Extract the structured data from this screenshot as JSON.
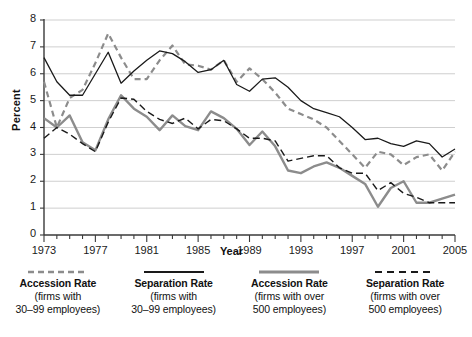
{
  "chart_data": {
    "type": "line",
    "title": "",
    "xlabel": "Year",
    "ylabel": "Percent",
    "xlim": [
      1973,
      2005
    ],
    "ylim": [
      0,
      8
    ],
    "yticks": [
      0,
      1,
      2,
      3,
      4,
      5,
      6,
      7,
      8
    ],
    "xticks": [
      1973,
      1977,
      1981,
      1985,
      1989,
      1993,
      1997,
      2001,
      2005
    ],
    "xtick_labels": [
      "1973",
      "1977",
      "1981",
      "1985",
      "1989",
      "1993",
      "1997",
      "2001",
      "2005"
    ],
    "grid": "horizontal",
    "legend_position": "bottom",
    "x": [
      1973,
      1974,
      1975,
      1976,
      1977,
      1978,
      1979,
      1980,
      1981,
      1982,
      1983,
      1984,
      1985,
      1986,
      1987,
      1988,
      1989,
      1990,
      1991,
      1992,
      1993,
      1994,
      1995,
      1996,
      1997,
      1998,
      1999,
      2000,
      2001,
      2002,
      2003,
      2004,
      2005
    ],
    "series": [
      {
        "name": "Accession Rate (firms with 30-99 employees)",
        "style": "dashed",
        "color": "#8c8c8c",
        "width": 2.2,
        "values": [
          5.7,
          4.0,
          5.1,
          5.4,
          6.4,
          7.5,
          6.6,
          5.8,
          5.8,
          6.5,
          7.05,
          6.35,
          6.3,
          6.15,
          6.5,
          5.7,
          6.2,
          5.8,
          5.3,
          4.7,
          4.5,
          4.3,
          4.0,
          3.5,
          3.0,
          2.5,
          3.1,
          3.0,
          2.6,
          2.9,
          3.0,
          2.4,
          3.1
        ]
      },
      {
        "name": "Separation Rate (firms with 30-99 employees)",
        "style": "solid",
        "color": "#1a1a1a",
        "width": 1.3,
        "values": [
          6.6,
          5.7,
          5.2,
          5.2,
          6.0,
          6.8,
          5.65,
          6.1,
          6.5,
          6.85,
          6.75,
          6.45,
          6.05,
          6.15,
          6.5,
          5.6,
          5.35,
          5.8,
          5.85,
          5.5,
          5.0,
          4.7,
          4.55,
          4.4,
          4.0,
          3.55,
          3.6,
          3.4,
          3.3,
          3.5,
          3.4,
          2.9,
          3.2
        ]
      },
      {
        "name": "Accession Rate (firms with over 500 employees)",
        "style": "solid",
        "color": "#8c8c8c",
        "width": 2.4,
        "values": [
          4.35,
          4.0,
          4.45,
          3.45,
          3.15,
          4.3,
          5.2,
          4.7,
          4.4,
          3.9,
          4.45,
          4.05,
          3.9,
          4.6,
          4.35,
          3.95,
          3.35,
          3.85,
          3.3,
          2.4,
          2.3,
          2.55,
          2.7,
          2.5,
          2.2,
          1.9,
          1.05,
          1.75,
          2.0,
          1.2,
          1.2,
          1.35,
          1.5
        ]
      },
      {
        "name": "Separation Rate (firms with over 500 employees)",
        "style": "dashed",
        "color": "#1a1a1a",
        "width": 1.4,
        "values": [
          3.6,
          4.0,
          3.75,
          3.4,
          3.1,
          4.2,
          5.1,
          5.05,
          4.6,
          4.3,
          4.15,
          4.35,
          3.95,
          4.3,
          4.25,
          3.95,
          3.6,
          3.6,
          3.5,
          2.75,
          2.85,
          2.95,
          2.95,
          2.5,
          2.3,
          2.3,
          1.65,
          1.95,
          1.55,
          1.4,
          1.2,
          1.2,
          1.2
        ]
      }
    ]
  },
  "legend": [
    {
      "title": "Accession Rate",
      "line1": "(firms with",
      "line2": "30–99 employees)",
      "swatch": "dashed-gray"
    },
    {
      "title": "Separation Rate",
      "line1": "(firms with",
      "line2": "30–99 employees)",
      "swatch": "solid-black"
    },
    {
      "title": "Accession Rate",
      "line1": "(firms with over",
      "line2": "500 employees)",
      "swatch": "solid-gray"
    },
    {
      "title": "Separation Rate",
      "line1": "(firms with over",
      "line2": "500 employees)",
      "swatch": "dashed-black"
    }
  ],
  "colors": {
    "gray": "#8c8c8c",
    "black": "#1a1a1a",
    "grid": "#c9c9c9",
    "axis": "#555555"
  }
}
